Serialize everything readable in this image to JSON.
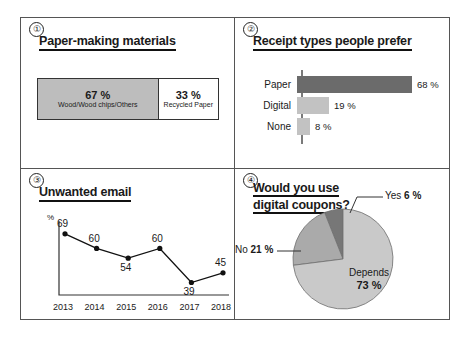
{
  "document": {
    "panels": [
      {
        "number": "①",
        "title": "Paper-making materials",
        "chart_data": {
          "type": "bar",
          "orientation": "stacked-horizontal",
          "title": "Paper-making materials",
          "categories": [
            "Wood/Wood chips/Others",
            "Recycled Paper"
          ],
          "values": [
            67,
            33
          ],
          "value_labels": [
            "67 %",
            "33 %"
          ],
          "colors": [
            "#bdbdbd",
            "#ffffff"
          ],
          "xlabel": "",
          "ylabel": "",
          "xlim": [
            0,
            100
          ],
          "grid": false,
          "legend": "inside-segments"
        }
      },
      {
        "number": "②",
        "title": "Receipt types people prefer",
        "chart_data": {
          "type": "bar",
          "orientation": "horizontal",
          "title": "Receipt types people prefer",
          "categories": [
            "Paper",
            "Digital",
            "None"
          ],
          "values": [
            68,
            19,
            8
          ],
          "value_labels": [
            "68 %",
            "19 %",
            "8 %"
          ],
          "colors": [
            "#6b6b6b",
            "#c2c2c2",
            "#c2c2c2"
          ],
          "xlabel": "",
          "ylabel": "",
          "xlim": [
            0,
            80
          ],
          "grid": false,
          "legend": "none"
        }
      },
      {
        "number": "③",
        "title": "Unwanted email",
        "axis_unit": "%",
        "chart_data": {
          "type": "line",
          "title": "Unwanted email",
          "x": [
            "2013",
            "2014",
            "2015",
            "2016",
            "2017",
            "2018"
          ],
          "values": [
            69,
            60,
            54,
            60,
            39,
            45
          ],
          "value_labels": [
            "69",
            "60",
            "54",
            "60",
            "39",
            "45"
          ],
          "label_positions": [
            "above",
            "above",
            "below",
            "above",
            "below",
            "above"
          ],
          "xlabel": "",
          "ylabel": "%",
          "ylim": [
            30,
            75
          ],
          "grid": false,
          "legend": "none",
          "marker": "filled-circle",
          "color": "#111111"
        }
      },
      {
        "number": "④",
        "title_line1": "Would you use",
        "title_line2": "digital coupons?",
        "chart_data": {
          "type": "pie",
          "title": "Would you use digital coupons?",
          "categories": [
            "Yes",
            "No",
            "Depends"
          ],
          "values": [
            6,
            21,
            73
          ],
          "value_labels": [
            "6 %",
            "21 %",
            "73 %"
          ],
          "colors": [
            "#777777",
            "#aaaaaa",
            "#c9c9c9"
          ],
          "start_angle_deg": 0,
          "direction": "counterclockwise",
          "legend": "callout-labels"
        }
      }
    ],
    "labels": {
      "yes": "Yes",
      "no": "No",
      "depends": "Depends",
      "yes_pct": "6 %",
      "no_pct": "21 %",
      "depends_pct": "73 %",
      "wood_pct": "67 %",
      "wood_label": "Wood/Wood chips/Others",
      "recycled_pct": "33 %",
      "recycled_label": "Recycled Paper"
    }
  }
}
